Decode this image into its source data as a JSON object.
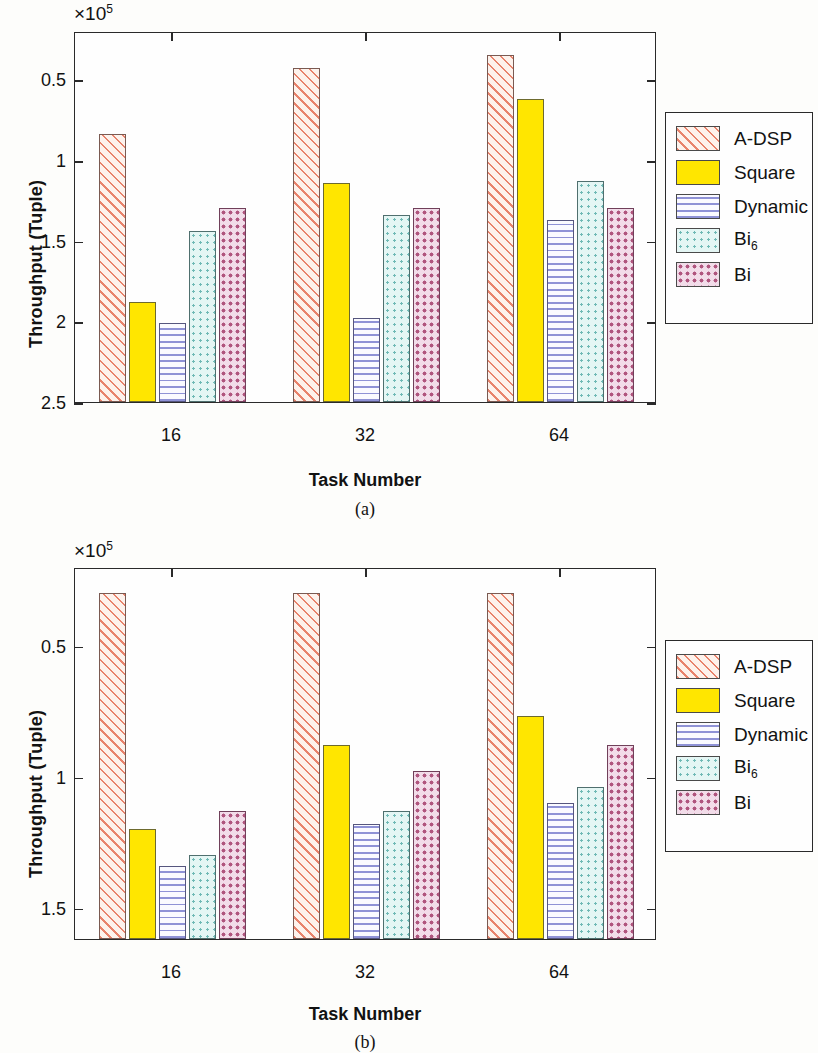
{
  "figure_a": {
    "name": "(a)",
    "caption": "(a)",
    "exponent_prefix": "×10",
    "exponent_power": "5",
    "ylabel": "Throughput (Tuple)",
    "xlabel": "Task Number",
    "yticks": [
      "2.5",
      "2",
      "1.5",
      "1",
      "0.5"
    ],
    "xticks": [
      "16",
      "32",
      "64"
    ],
    "legend": [
      {
        "label": "A-DSP",
        "sub": "",
        "pattern": "diagonal-hatch",
        "color": "#e8836c"
      },
      {
        "label": "Square",
        "sub": "",
        "pattern": "solid",
        "color": "#ffe600"
      },
      {
        "label": "Dynamic",
        "sub": "",
        "pattern": "horizontal-lines",
        "color": "#8f92d6"
      },
      {
        "label": "Bi",
        "sub": "6",
        "pattern": "dots",
        "color": "#6fb9b5"
      },
      {
        "label": "Bi",
        "sub": "",
        "pattern": "checker-dots",
        "color": "#b0557e"
      }
    ]
  },
  "figure_b": {
    "name": "(b)",
    "caption": "(b)",
    "exponent_prefix": "×10",
    "exponent_power": "5",
    "ylabel": "Throughput (Tuple)",
    "xlabel": "Task Number",
    "yticks": [
      "1.5",
      "1",
      "0.5"
    ],
    "xticks": [
      "16",
      "32",
      "64"
    ],
    "legend": [
      {
        "label": "A-DSP",
        "sub": "",
        "pattern": "diagonal-hatch",
        "color": "#e8836c"
      },
      {
        "label": "Square",
        "sub": "",
        "pattern": "solid",
        "color": "#ffe600"
      },
      {
        "label": "Dynamic",
        "sub": "",
        "pattern": "horizontal-lines",
        "color": "#8f92d6"
      },
      {
        "label": "Bi",
        "sub": "6",
        "pattern": "dots",
        "color": "#6fb9b5"
      },
      {
        "label": "Bi",
        "sub": "",
        "pattern": "checker-dots",
        "color": "#b0557e"
      }
    ]
  },
  "chart_data": [
    {
      "type": "bar",
      "title": "(a)",
      "xlabel": "Task Number",
      "ylabel": "Throughput (Tuple)",
      "y_exponent": "×10^5",
      "categories": [
        "16",
        "32",
        "64"
      ],
      "ylim": [
        0.5,
        2.8
      ],
      "yticks": [
        0.5,
        1.0,
        1.5,
        2.0,
        2.5
      ],
      "grid": false,
      "legend_position": "right",
      "series": [
        {
          "name": "A-DSP",
          "values": [
            2.16,
            2.57,
            2.65
          ]
        },
        {
          "name": "Square",
          "values": [
            1.12,
            1.86,
            2.38
          ]
        },
        {
          "name": "Dynamic",
          "values": [
            0.99,
            1.02,
            1.63
          ]
        },
        {
          "name": "Bi6",
          "values": [
            1.56,
            1.66,
            1.87
          ]
        },
        {
          "name": "Bi",
          "values": [
            1.7,
            1.7,
            1.7
          ]
        }
      ]
    },
    {
      "type": "bar",
      "title": "(b)",
      "xlabel": "Task Number",
      "ylabel": "Throughput (Tuple)",
      "y_exponent": "×10^5",
      "categories": [
        "16",
        "32",
        "64"
      ],
      "ylim": [
        0.38,
        1.8
      ],
      "yticks": [
        0.5,
        1.0,
        1.5
      ],
      "grid": false,
      "legend_position": "right",
      "series": [
        {
          "name": "A-DSP",
          "values": [
            1.7,
            1.7,
            1.7
          ]
        },
        {
          "name": "Square",
          "values": [
            0.8,
            1.12,
            1.23
          ]
        },
        {
          "name": "Dynamic",
          "values": [
            0.66,
            0.82,
            0.9
          ]
        },
        {
          "name": "Bi6",
          "values": [
            0.7,
            0.87,
            0.96
          ]
        },
        {
          "name": "Bi",
          "values": [
            0.87,
            1.02,
            1.12
          ]
        }
      ]
    }
  ]
}
